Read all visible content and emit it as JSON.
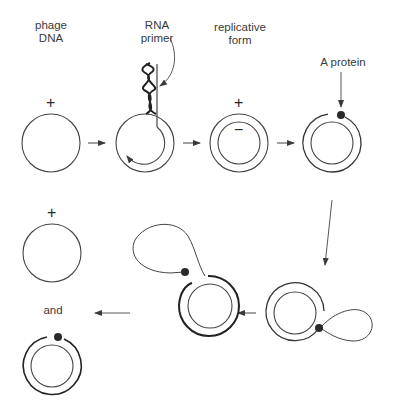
{
  "labels": {
    "phage_dna_line1": "phage",
    "phage_dna_line2": "DNA",
    "rna_primer_line1": "RNA",
    "rna_primer_line2": "primer",
    "replicative_form_line1": "replicative",
    "replicative_form_line2": "form",
    "a_protein": "A protein",
    "and": "and"
  },
  "signs": {
    "plus": "+",
    "minus": "−"
  },
  "stages": [
    {
      "id": "phage-dna",
      "strands": "single",
      "polarity": "+"
    },
    {
      "id": "primer-initiation",
      "strands": "single-with-primer"
    },
    {
      "id": "replicative-form",
      "strands": "double",
      "polarity": "+/-"
    },
    {
      "id": "a-protein-nick",
      "strands": "double-nicked"
    },
    {
      "id": "rolling-circle-start",
      "strands": "double-with-tail"
    },
    {
      "id": "rolling-circle-loop",
      "strands": "double-with-loop"
    },
    {
      "id": "products",
      "strands": "single-plus-and-double",
      "polarity": "+"
    }
  ],
  "colors": {
    "ink": "#3a3a3a",
    "dot": "#2a2a2a"
  }
}
